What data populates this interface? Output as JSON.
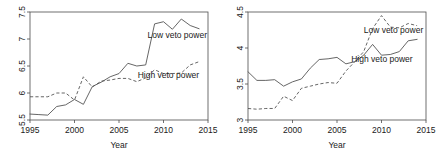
{
  "figure": {
    "panel_count": 2,
    "background_color": "#ffffff",
    "line_color": "#555555",
    "axis_color": "#4d4d4d"
  },
  "chart_data": [
    {
      "type": "line",
      "title": "",
      "xlabel": "Year",
      "ylabel": "",
      "xlim": [
        1995,
        2015
      ],
      "ylim": [
        5.5,
        7.5
      ],
      "xticks": [
        1995,
        2000,
        2005,
        2010,
        2015
      ],
      "xtick_labels": [
        "1995",
        "2000",
        "2005",
        "2010",
        "2015"
      ],
      "yticks": [
        5.5,
        6,
        6.5,
        7,
        7.5
      ],
      "ytick_labels": [
        "5.5",
        "6",
        "6.5",
        "7",
        "7.5"
      ],
      "grid": false,
      "legend_position": "inline-annotation",
      "x": [
        1995,
        1996,
        1997,
        1998,
        1999,
        2000,
        2001,
        2002,
        2003,
        2004,
        2005,
        2006,
        2007,
        2008,
        2009,
        2010,
        2011,
        2012,
        2013,
        2014
      ],
      "series": [
        {
          "name": "Low veto power",
          "style": "solid",
          "values": [
            5.61,
            5.6,
            5.59,
            5.75,
            5.78,
            5.88,
            5.79,
            6.12,
            6.2,
            6.3,
            6.36,
            6.55,
            6.5,
            6.52,
            7.28,
            7.32,
            7.18,
            7.37,
            7.25,
            7.19
          ],
          "label": "Low veto power",
          "label_x": 2008.2,
          "label_y": 7.02
        },
        {
          "name": "High veto power",
          "style": "dashed",
          "values": [
            5.93,
            5.93,
            5.93,
            6.0,
            6.0,
            5.87,
            6.3,
            6.11,
            6.22,
            6.24,
            6.27,
            6.27,
            6.21,
            6.28,
            6.43,
            6.36,
            6.36,
            6.37,
            6.52,
            6.58
          ],
          "label": "High veto power",
          "label_x": 2007.1,
          "label_y": 6.27
        }
      ]
    },
    {
      "type": "line",
      "title": "",
      "xlabel": "Year",
      "ylabel": "",
      "xlim": [
        1995,
        2015
      ],
      "ylim": [
        3,
        4.5
      ],
      "xticks": [
        1995,
        2000,
        2005,
        2010,
        2015
      ],
      "xtick_labels": [
        "1995",
        "2000",
        "2005",
        "2010",
        "2015"
      ],
      "yticks": [
        3,
        3.5,
        4,
        4.5
      ],
      "ytick_labels": [
        "3",
        "3.5",
        "4",
        "4.5"
      ],
      "grid": false,
      "legend_position": "inline-annotation",
      "x": [
        1995,
        1996,
        1997,
        1998,
        1999,
        2000,
        2001,
        2002,
        2003,
        2004,
        2005,
        2006,
        2007,
        2008,
        2009,
        2010,
        2011,
        2012,
        2013,
        2014
      ],
      "series": [
        {
          "name": "Low veto power",
          "style": "dashed",
          "values": [
            3.16,
            3.15,
            3.16,
            3.16,
            3.33,
            3.27,
            3.44,
            3.47,
            3.5,
            3.52,
            3.51,
            3.68,
            3.81,
            3.95,
            4.27,
            4.45,
            4.29,
            4.28,
            4.34,
            4.31
          ],
          "label": "Low veto power",
          "label_x": 2008.0,
          "label_y": 4.21
        },
        {
          "name": "High veto power",
          "style": "solid",
          "values": [
            3.67,
            3.55,
            3.55,
            3.56,
            3.47,
            3.53,
            3.57,
            3.72,
            3.84,
            3.85,
            3.87,
            3.78,
            3.81,
            3.9,
            4.05,
            3.9,
            3.91,
            3.95,
            4.1,
            4.12
          ],
          "label": "High veto power",
          "label_x": 2006.6,
          "label_y": 3.8
        }
      ]
    }
  ]
}
